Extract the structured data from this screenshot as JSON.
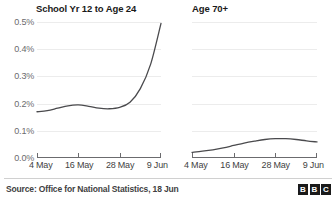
{
  "chart_data": [
    {
      "type": "line",
      "title": "School Yr 12 to Age 24",
      "panel": "left",
      "xlabel": "",
      "ylabel": "",
      "ylim": [
        0.0,
        0.5
      ],
      "yticks": [
        0.0,
        0.1,
        0.2,
        0.3,
        0.4,
        0.5
      ],
      "ytick_labels": [
        "0.0%",
        "0.1%",
        "0.2%",
        "0.3%",
        "0.4%",
        "0.5%"
      ],
      "xticks": [
        0,
        12,
        24,
        36
      ],
      "xtick_labels": [
        "4 May",
        "16 May",
        "28 May",
        "9 Jun"
      ],
      "grid": true,
      "legend": "none",
      "x": [
        0,
        3,
        6,
        9,
        12,
        15,
        18,
        21,
        24,
        27,
        30,
        33,
        36
      ],
      "values": [
        0.17,
        0.174,
        0.183,
        0.192,
        0.195,
        0.19,
        0.183,
        0.181,
        0.186,
        0.205,
        0.255,
        0.345,
        0.495
      ],
      "series": [
        {
          "name": "School Yr 12 to Age 24",
          "color": "#4a4a4d",
          "values": [
            0.17,
            0.174,
            0.183,
            0.192,
            0.195,
            0.19,
            0.183,
            0.181,
            0.186,
            0.205,
            0.255,
            0.345,
            0.495
          ]
        }
      ]
    },
    {
      "type": "line",
      "title": "Age 70+",
      "panel": "right",
      "xlabel": "",
      "ylabel": "",
      "ylim": [
        0.0,
        0.5
      ],
      "yticks": [
        0.0,
        0.1,
        0.2,
        0.3,
        0.4,
        0.5
      ],
      "ytick_labels": [
        "0.0%",
        "0.1%",
        "0.2%",
        "0.3%",
        "0.4%",
        "0.5%"
      ],
      "xticks": [
        0,
        12,
        24,
        36
      ],
      "xtick_labels": [
        "4 May",
        "16 May",
        "28 May",
        "9 Jun"
      ],
      "grid": true,
      "legend": "none",
      "x": [
        0,
        3,
        6,
        9,
        12,
        15,
        18,
        21,
        24,
        27,
        30,
        33,
        36
      ],
      "values": [
        0.021,
        0.025,
        0.03,
        0.037,
        0.046,
        0.055,
        0.062,
        0.068,
        0.071,
        0.071,
        0.068,
        0.063,
        0.059
      ],
      "series": [
        {
          "name": "Age 70+",
          "color": "#4a4a4d",
          "values": [
            0.021,
            0.025,
            0.03,
            0.037,
            0.046,
            0.055,
            0.062,
            0.068,
            0.071,
            0.071,
            0.068,
            0.063,
            0.059
          ]
        }
      ]
    }
  ],
  "panels": {
    "left": {
      "title": "School Yr 12 to Age 24"
    },
    "right": {
      "title": "Age 70+"
    }
  },
  "axis": {
    "ytick_labels": [
      "0.5%",
      "0.4%",
      "0.3%",
      "0.2%",
      "0.1%",
      "0.0%"
    ],
    "xtick_labels": [
      "4 May",
      "16 May",
      "28 May",
      "9 Jun"
    ]
  },
  "footer": {
    "source": "Source: Office for National Statistics, 18 Jun",
    "logo": [
      "B",
      "B",
      "C"
    ]
  },
  "colors": {
    "line": "#4a4a4d",
    "gridline": "#ececec",
    "axis": "#6b6b6e",
    "text": "#3f3f42",
    "title": "#1a1a1a",
    "background": "#ffffff"
  }
}
